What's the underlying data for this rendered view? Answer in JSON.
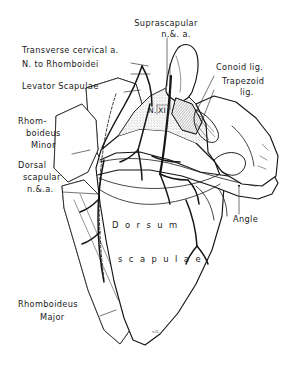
{
  "figure": {
    "background_color": "#ffffff",
    "ink_color": "#151515",
    "signature": "v.G."
  },
  "labels": {
    "suprascapular": {
      "line1": "Suprascapular",
      "line2": "n.&. a."
    },
    "transverse_cervical": {
      "text": "Transverse cervical a."
    },
    "nerve_to_rhomboidei": {
      "text": "N. to Rhomboidei"
    },
    "levator_scapulae": {
      "text": "Levator Scapulae"
    },
    "rhomboideus_minor": {
      "line1": "Rhom-",
      "line2": "boideus",
      "line3": "Minor"
    },
    "dorsal_scapular": {
      "line1": "Dorsal",
      "line2": "scapular",
      "line3": "n.&.a."
    },
    "rhomboideus_major": {
      "line1": "Rhomboideus",
      "line2": "Major"
    },
    "dorsum_scapulae": {
      "line1": "D o r s u m",
      "line2": "s c a p u l a e"
    },
    "conoid": {
      "text": "Conoid lig."
    },
    "trapezoid": {
      "line1": "Trapezoid",
      "line2": "lig."
    },
    "angle": {
      "text": "Angle"
    },
    "nerve_xi": {
      "prefix": "N.",
      "numeral": "XI"
    }
  }
}
